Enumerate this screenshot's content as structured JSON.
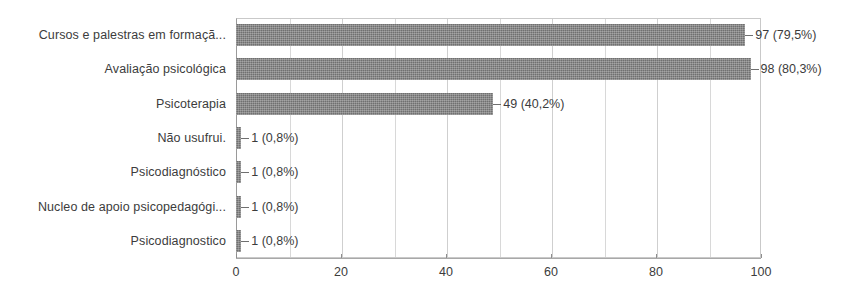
{
  "chart_data": {
    "type": "bar",
    "orientation": "horizontal",
    "title": "",
    "subtitle": "",
    "xlabel": "",
    "ylabel": "",
    "xlim": [
      0,
      100
    ],
    "xticks": [
      0,
      20,
      40,
      60,
      80,
      100
    ],
    "xtick_labels": [
      "0",
      "20",
      "40",
      "60",
      "80",
      "100"
    ],
    "grid": true,
    "gridlines_minor": [
      10,
      30,
      50,
      70,
      90
    ],
    "legend": "none",
    "bar_color": "#707070",
    "categories": [
      "Cursos e palestras em formaçã...",
      "Avaliação psicológica",
      "Psicoterapia",
      "Não usufrui.",
      "Psicodiagnóstico",
      "Nucleo de apoio psicopedagógi...",
      "Psicodiagnostico"
    ],
    "values": [
      97,
      98,
      49,
      1,
      1,
      1,
      1
    ],
    "percents": [
      "79,5%",
      "80,3%",
      "40,2%",
      "0,8%",
      "0,8%",
      "0,8%",
      "0,8%"
    ],
    "data_labels": [
      "97 (79,5%)",
      "98 (80,3%)",
      "49 (40,2%)",
      "1 (0,8%)",
      "1 (0,8%)",
      "1 (0,8%)",
      "1 (0,8%)"
    ]
  }
}
